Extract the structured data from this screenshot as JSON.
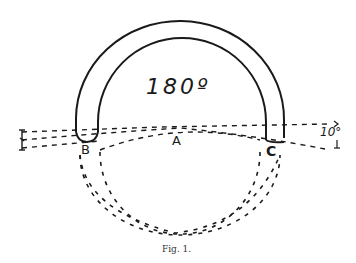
{
  "figure": {
    "caption": "Fig. 1.",
    "angle_label": "180º",
    "tilt_label": "10°",
    "points": {
      "a": "A",
      "b": "B",
      "c": "C"
    }
  },
  "colors": {
    "ink": "#1a1a1a",
    "background": "#ffffff"
  }
}
